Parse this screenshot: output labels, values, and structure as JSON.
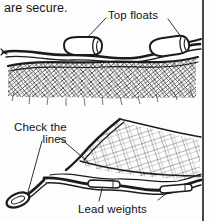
{
  "page": {
    "background_color": "#fdfdfd",
    "ink_color": "#1b1b1b",
    "border": {
      "right_rule": true,
      "color": "#1b1b1b"
    }
  },
  "body_text": {
    "continuation_line": "are secure."
  },
  "figures": [
    {
      "id": "top-figure",
      "name": "float-line-diagram",
      "description": "Top of a fishing net: headrope with two cylindrical top floats attached, above a band of diamond mesh netting",
      "callouts": [
        {
          "name": "top-floats",
          "label": "Top floats",
          "leader_lines": 2,
          "points_to": [
            "left-float",
            "right-float"
          ]
        }
      ],
      "parts": [
        {
          "name": "headrope",
          "label": "head rope"
        },
        {
          "name": "left-float",
          "label": "float"
        },
        {
          "name": "right-float",
          "label": "float"
        },
        {
          "name": "net-mesh",
          "label": "diamond mesh netting"
        }
      ]
    },
    {
      "id": "bottom-figure",
      "name": "lead-line-diagram",
      "description": "Bottom of a fishing net: footrope with lead weights, rope eye splice at left, and angled square mesh panel",
      "callouts": [
        {
          "name": "check-the-lines",
          "label_line_1": "Check the",
          "label_line_2": "lines",
          "leader_lines": 2,
          "points_to": [
            "rope-eye",
            "line-junction"
          ]
        },
        {
          "name": "lead-weights",
          "label": "Lead weights",
          "leader_lines": 2,
          "points_to": [
            "left-weight",
            "right-weight"
          ]
        }
      ],
      "parts": [
        {
          "name": "rope-eye",
          "label": "spliced rope eye"
        },
        {
          "name": "footrope",
          "label": "foot rope"
        },
        {
          "name": "left-weight",
          "label": "lead weight"
        },
        {
          "name": "right-weight",
          "label": "lead weight"
        },
        {
          "name": "net-panel",
          "label": "square mesh panel"
        }
      ]
    }
  ]
}
